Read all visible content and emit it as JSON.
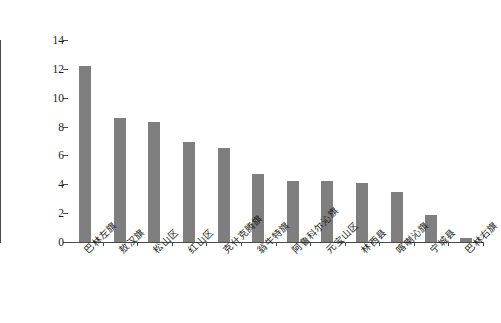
{
  "chart_data": {
    "type": "bar",
    "title": "",
    "subtitle": "",
    "xlabel": "",
    "ylabel": "人均公园绿地面积（平方米/人）",
    "ylim": [
      0,
      14
    ],
    "ytick_step": 2,
    "yticks": [
      "14",
      "12",
      "10",
      "8",
      "6",
      "4",
      "2",
      "0"
    ],
    "ytick_values": [
      14,
      12,
      10,
      8,
      6,
      4,
      2,
      0
    ],
    "grid": false,
    "legend": null,
    "bar_color": "#7f7f7f",
    "axis_color": "#4a4a4a",
    "background_color": "#ffffff",
    "categories": [
      "巴林左旗",
      "敖汉旗",
      "松山区",
      "红山区",
      "克什克腾旗",
      "翁牛特旗",
      "阿鲁科尔沁旗",
      "元宝山区",
      "林西县",
      "喀喇沁旗",
      "宁城县",
      "巴林右旗"
    ],
    "values": [
      12.2,
      8.6,
      8.3,
      6.9,
      6.5,
      4.7,
      4.25,
      4.2,
      4.1,
      3.5,
      1.9,
      0.25
    ]
  }
}
